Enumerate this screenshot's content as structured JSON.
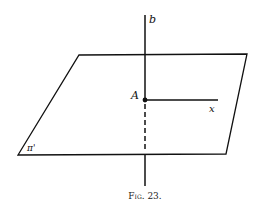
{
  "figure": {
    "caption": "Fig. 23.",
    "labels": {
      "line": "b",
      "point": "A",
      "ray": "x",
      "plane": "π'"
    },
    "colors": {
      "stroke": "#111111",
      "background": "#ffffff"
    }
  }
}
